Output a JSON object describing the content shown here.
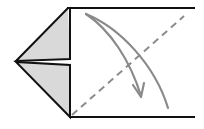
{
  "diagram": {
    "kind": "origami-fold-step",
    "colors": {
      "background": "#ffffff",
      "outline": "#111111",
      "flap_fill": "#d9d9d9",
      "fold_line": "#8c8c8c",
      "arrow": "#8a8a8a"
    },
    "elements": {
      "paper": "rectangular paper body",
      "upper_flap": "upper triangular flap (shaded)",
      "lower_flap": "lower triangular flap (shaded)",
      "valley_fold_line": "dashed diagonal fold line",
      "fold_arrow": "curved arrow showing fold direction"
    }
  }
}
